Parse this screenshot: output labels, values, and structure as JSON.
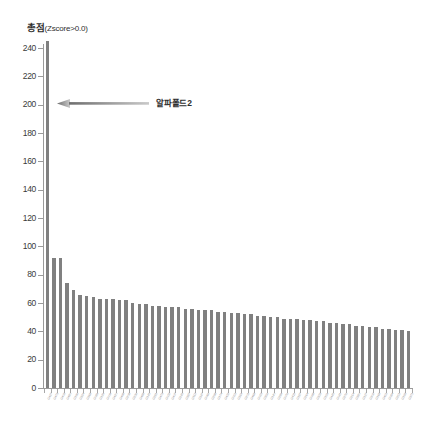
{
  "chart_data": {
    "type": "bar",
    "title": "총점(Zscore>0.0)",
    "title_main": "총점",
    "title_sub": "(Zscore>0.0)",
    "xlabel": "",
    "ylabel": "",
    "ylim": [
      0,
      240
    ],
    "ytick_step": 20,
    "yticks": [
      0,
      20,
      40,
      60,
      80,
      100,
      120,
      140,
      160,
      180,
      200,
      220,
      240
    ],
    "ytick_labels": [
      "0",
      "20",
      "40",
      "60",
      "80",
      "100",
      "120",
      "140",
      "160",
      "180",
      "200",
      "220",
      "240"
    ],
    "grid": false,
    "legend": null,
    "bar_color": "#808080",
    "axis_color": "#9a9a9a",
    "n_bars": 56,
    "categories": [
      "G427",
      "G473",
      "G403",
      "G480",
      "G196",
      "G324",
      "G368",
      "G089",
      "G129",
      "G009",
      "G420",
      "G498",
      "G208",
      "G236",
      "G488",
      "G145",
      "G281",
      "G473",
      "G032",
      "G407",
      "G245",
      "G387",
      "G112",
      "G347",
      "G066",
      "G298",
      "G174",
      "G432",
      "G055",
      "G319",
      "G201",
      "G468",
      "G023",
      "G356",
      "G140",
      "G289",
      "G076",
      "G411",
      "G187",
      "G264",
      "G098",
      "G333",
      "G159",
      "G445",
      "G041",
      "G276",
      "G214",
      "G380",
      "G127",
      "G302",
      "G168",
      "G455",
      "G084",
      "G251",
      "G193",
      "G371"
    ],
    "values": [
      245,
      92,
      92,
      74,
      69,
      66,
      65,
      64,
      63,
      63,
      63,
      62,
      62,
      60,
      59,
      59,
      58,
      58,
      57,
      57,
      57,
      56,
      56,
      55,
      55,
      55,
      54,
      54,
      53,
      53,
      52,
      52,
      51,
      51,
      50,
      50,
      49,
      49,
      49,
      48,
      48,
      47,
      47,
      46,
      46,
      45,
      45,
      44,
      44,
      43,
      43,
      42,
      42,
      41,
      41,
      40
    ],
    "annotations": [
      {
        "text": "알파폴드2",
        "target_value": 245,
        "target_index": 0,
        "at_y": 200,
        "arrow": "left-arrow",
        "color": "#8a8a8a"
      }
    ]
  },
  "annotation": {
    "label": "알파폴드2",
    "arrow_name": "left-arrow"
  }
}
